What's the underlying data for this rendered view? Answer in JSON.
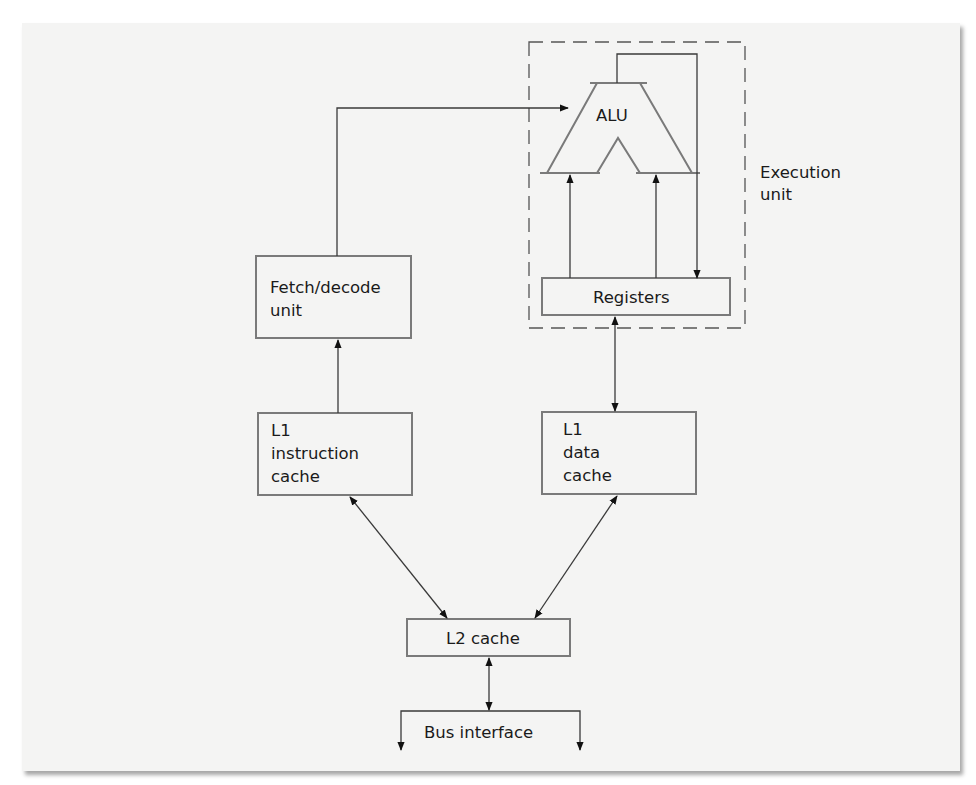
{
  "diagram": {
    "title": "",
    "nodes": {
      "alu": {
        "label": "ALU"
      },
      "execution_unit": {
        "line1": "Execution",
        "line2": "unit"
      },
      "registers": {
        "label": "Registers"
      },
      "fetch_decode": {
        "line1": "Fetch/decode",
        "line2": "unit"
      },
      "l1_instruction": {
        "line1": "L1",
        "line2": "instruction",
        "line3": "cache"
      },
      "l1_data": {
        "line1": "L1",
        "line2": "data",
        "line3": "cache"
      },
      "l2_cache": {
        "label": "L2 cache"
      },
      "bus_interface": {
        "label": "Bus interface"
      }
    },
    "edges": [
      {
        "from": "fetch_decode",
        "to": "alu",
        "type": "directed"
      },
      {
        "from": "registers",
        "to": "alu",
        "type": "directed",
        "note": "left input"
      },
      {
        "from": "registers",
        "to": "alu",
        "type": "directed",
        "note": "right input"
      },
      {
        "from": "alu",
        "to": "registers",
        "type": "directed",
        "note": "result feedback"
      },
      {
        "from": "l1_instruction",
        "to": "fetch_decode",
        "type": "directed"
      },
      {
        "from": "registers",
        "to": "l1_data",
        "type": "bidirectional"
      },
      {
        "from": "l1_instruction",
        "to": "l2_cache",
        "type": "bidirectional"
      },
      {
        "from": "l1_data",
        "to": "l2_cache",
        "type": "bidirectional"
      },
      {
        "from": "l2_cache",
        "to": "bus_interface",
        "type": "bidirectional"
      }
    ],
    "colors": {
      "page": "#f4f4f3",
      "box_stroke": "#7a7a7a",
      "line": "#3a3a3a",
      "text": "#1a1a1a"
    }
  }
}
